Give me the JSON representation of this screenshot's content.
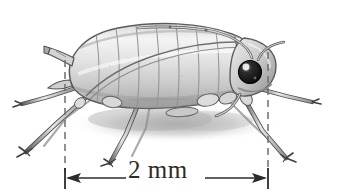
{
  "figure": {
    "style": "grayscale pencil/stipple scientific illustration",
    "background_color": "#ffffff"
  },
  "scale_bar": {
    "label": "2 mm",
    "value": 2,
    "unit": "mm",
    "left_tick_x": 65,
    "right_tick_x": 268,
    "baseline_y": 178,
    "arrow_style": "double-headed",
    "line_color": "#2b2b2b"
  },
  "guides": {
    "left_dashed_line": {
      "x": 65,
      "y_top": 60,
      "y_bottom": 172
    },
    "right_dashed_line": {
      "x": 268,
      "y_top": 52,
      "y_bottom": 172
    },
    "dash_color": "#6e6e6e"
  },
  "anatomy": {
    "body_color_light": "#f2f2f2",
    "body_color_mid": "#bdbdbd",
    "body_color_dark": "#8a8a8a",
    "outline_color": "#4a4a4a",
    "eye_color": "#101010",
    "shadow_color": "#b9b9b9",
    "parts": [
      {
        "name": "abdomen",
        "label": "abdomen"
      },
      {
        "name": "thorax",
        "label": "thorax"
      },
      {
        "name": "head",
        "label": "head"
      },
      {
        "name": "compound-eye",
        "label": "compound eye"
      },
      {
        "name": "antenna",
        "label": "antenna"
      },
      {
        "name": "cornicle",
        "label": "cornicle"
      },
      {
        "name": "cauda",
        "label": "cauda"
      },
      {
        "name": "foreleg",
        "label": "foreleg"
      },
      {
        "name": "midleg",
        "label": "midleg"
      },
      {
        "name": "hindleg",
        "label": "hindleg"
      },
      {
        "name": "rostrum",
        "label": "rostrum"
      },
      {
        "name": "ground-shadow",
        "label": "cast shadow"
      }
    ]
  }
}
